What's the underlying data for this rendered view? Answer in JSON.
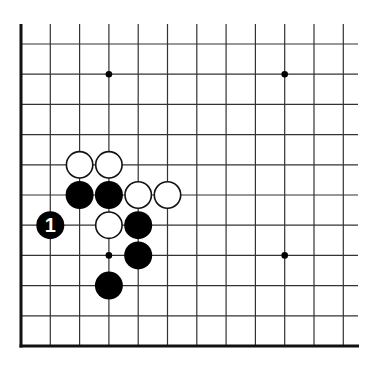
{
  "diagram": {
    "type": "go-board-corner",
    "corner": "bottom-left",
    "grid": {
      "columns": 12,
      "rows": 11,
      "origin_x": 21,
      "origin_y": 44,
      "col_spacing": 29.3,
      "row_spacing": 30.2,
      "top_extent_y": 24,
      "right_extent_x": 358,
      "line_color": "#333333",
      "edge_color": "#111111"
    },
    "star_points": [
      {
        "col": 3,
        "row": 1
      },
      {
        "col": 9,
        "row": 1
      },
      {
        "col": 3,
        "row": 7
      },
      {
        "col": 9,
        "row": 7
      }
    ],
    "stones": [
      {
        "color": "white",
        "col": 2,
        "row": 4,
        "label": ""
      },
      {
        "color": "white",
        "col": 3,
        "row": 4,
        "label": ""
      },
      {
        "color": "black",
        "col": 2,
        "row": 5,
        "label": ""
      },
      {
        "color": "black",
        "col": 3,
        "row": 5,
        "label": ""
      },
      {
        "color": "white",
        "col": 4,
        "row": 5,
        "label": ""
      },
      {
        "color": "white",
        "col": 5,
        "row": 5,
        "label": ""
      },
      {
        "color": "black",
        "col": 1,
        "row": 6,
        "label": "1"
      },
      {
        "color": "white",
        "col": 3,
        "row": 6,
        "label": ""
      },
      {
        "color": "black",
        "col": 4,
        "row": 6,
        "label": ""
      },
      {
        "color": "black",
        "col": 4,
        "row": 7,
        "label": ""
      },
      {
        "color": "black",
        "col": 3,
        "row": 8,
        "label": ""
      }
    ],
    "colors": {
      "black_stone": "#000000",
      "white_stone_fill": "#ffffff",
      "white_stone_stroke": "#111111",
      "label_on_black": "#ffffff"
    }
  }
}
